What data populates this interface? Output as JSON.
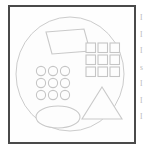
{
  "page": {
    "background_color": "#ffffff",
    "width": 152,
    "height": 150
  },
  "figure": {
    "name": "geometric-shapes-figure",
    "frame": {
      "border_color": "#4a4a4a",
      "border_width": 2,
      "background_color": "#fefefe"
    },
    "stroke_color": "#c9c9c9",
    "fill_color": "#fdfdfd",
    "container": {
      "shape": "circle",
      "label": "large outer circle",
      "cx": 62,
      "cy": 68,
      "r": 57
    },
    "shapes": [
      {
        "name": "parallelogram",
        "type": "parallelogram",
        "count": 1,
        "cx": 56,
        "cy": 34
      },
      {
        "name": "circle-grid",
        "type": "grid-of-circles",
        "rows": 3,
        "cols": 3,
        "count": 9,
        "cx": 44,
        "cy": 72
      },
      {
        "name": "square-grid",
        "type": "grid-of-squares",
        "rows": 3,
        "cols": 3,
        "count": 9,
        "cx": 94,
        "cy": 57
      },
      {
        "name": "triangle",
        "type": "triangle",
        "count": 1,
        "cx": 95,
        "cy": 100
      },
      {
        "name": "ellipse",
        "type": "ellipse",
        "count": 1,
        "cx": 50,
        "cy": 112
      }
    ]
  },
  "margin_text": {
    "color": "#b9b9b9",
    "lines": [
      "I",
      "I",
      "I",
      "s",
      "I",
      "I",
      "I"
    ]
  }
}
